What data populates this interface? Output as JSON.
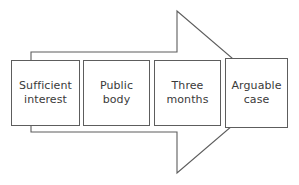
{
  "diagram": {
    "type": "process-arrow",
    "orientation": "left-to-right",
    "arrow": {
      "stroke_color": "#5d5d5d",
      "fill_color": "#ffffff",
      "shaft_top_y": 52,
      "shaft_bottom_y": 132,
      "shaft_left_x": 31,
      "head_base_x": 177,
      "head_top_y": 11,
      "head_bottom_y": 173,
      "tip_x": 232
    },
    "boxes": [
      {
        "index": 1,
        "label": "Sufficient\ninterest",
        "line_1": "Sufficient",
        "line_2": "interest"
      },
      {
        "index": 2,
        "label": "Public\nbody",
        "line_1": "Public",
        "line_2": "body"
      },
      {
        "index": 3,
        "label": "Three\nmonths",
        "line_1": "Three",
        "line_2": "months"
      },
      {
        "index": 4,
        "label": "Arguable\ncase",
        "line_1": "Arguable",
        "line_2": "case"
      }
    ]
  }
}
